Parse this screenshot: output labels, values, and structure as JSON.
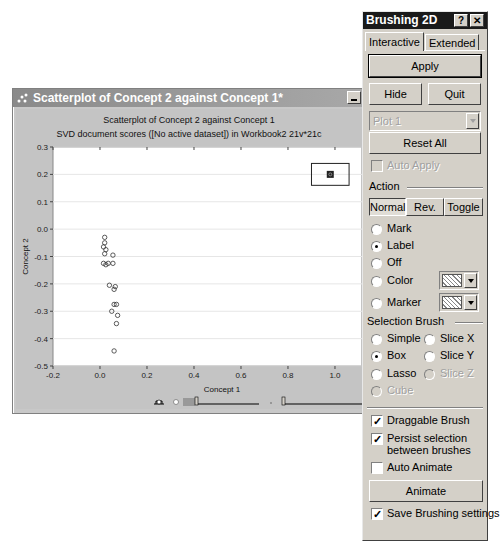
{
  "plot_window": {
    "title": "Scatterplot of Concept 2 against Concept 1*",
    "chart_title": "Scatterplot of Concept 2 against Concept 1",
    "chart_subtitle": "SVD document scores ([No active dataset]) in Workbook2 21v*21c"
  },
  "chart_data": {
    "type": "scatter",
    "title": "Scatterplot of Concept 2 against Concept 1",
    "subtitle": "SVD document scores ([No active dataset]) in Workbook2 21v*21c",
    "xlabel": "Concept 1",
    "ylabel": "Concept 2",
    "xlim": [
      -0.2,
      1.1
    ],
    "ylim": [
      -0.5,
      0.3
    ],
    "xticks": [
      "-0.2",
      "0.0",
      "0.2",
      "0.4",
      "0.6",
      "0.8",
      "1.0"
    ],
    "yticks": [
      "0.3",
      "0.2",
      "0.1",
      "0.0",
      "-0.1",
      "-0.2",
      "-0.3",
      "-0.4",
      "-0.5"
    ],
    "grid": "horizontal",
    "points": [
      {
        "x": 0.02,
        "y": -0.03
      },
      {
        "x": 0.02,
        "y": -0.05
      },
      {
        "x": 0.015,
        "y": -0.065
      },
      {
        "x": 0.025,
        "y": -0.075
      },
      {
        "x": 0.02,
        "y": -0.09
      },
      {
        "x": 0.055,
        "y": -0.095
      },
      {
        "x": 0.015,
        "y": -0.125
      },
      {
        "x": 0.025,
        "y": -0.13
      },
      {
        "x": 0.035,
        "y": -0.125
      },
      {
        "x": 0.055,
        "y": -0.125
      },
      {
        "x": 0.04,
        "y": -0.205
      },
      {
        "x": 0.065,
        "y": -0.21
      },
      {
        "x": 0.06,
        "y": -0.22
      },
      {
        "x": 0.06,
        "y": -0.275
      },
      {
        "x": 0.07,
        "y": -0.275
      },
      {
        "x": 0.05,
        "y": -0.3
      },
      {
        "x": 0.075,
        "y": -0.315
      },
      {
        "x": 0.07,
        "y": -0.345
      },
      {
        "x": 0.06,
        "y": -0.445
      }
    ],
    "selected_points": [
      {
        "x": 0.98,
        "y": 0.2
      }
    ],
    "brush_box": {
      "x0": 0.9,
      "x1": 1.06,
      "y0": 0.16,
      "y1": 0.24
    }
  },
  "dialog": {
    "title": "Brushing 2D",
    "help_btn": "?",
    "close_btn": "✕",
    "tabs": [
      "Interactive",
      "Extended"
    ],
    "apply": "Apply",
    "hide": "Hide",
    "quit": "Quit",
    "plot_select": "Plot 1",
    "reset_all": "Reset All",
    "auto_apply": "Auto Apply",
    "action_label": "Action",
    "mode_buttons": [
      "Normal",
      "Rev.",
      "Toggle"
    ],
    "actions": [
      "Mark",
      "Label",
      "Off",
      "Color",
      "Marker"
    ],
    "selected_action": "Label",
    "selection_brush_label": "Selection Brush",
    "brushes": [
      "Simple",
      "Slice X",
      "Box",
      "Slice Y",
      "Lasso",
      "Slice Z",
      "Cube"
    ],
    "selected_brush": "Box",
    "draggable_brush": "Draggable Brush",
    "persist_selection_1": "Persist selection",
    "persist_selection_2": "between brushes",
    "auto_animate": "Auto Animate",
    "animate": "Animate",
    "save_settings": "Save Brushing settings",
    "check": "✓"
  }
}
